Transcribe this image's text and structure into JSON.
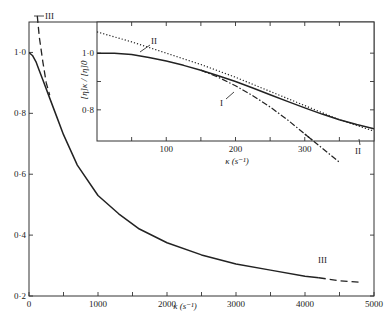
{
  "chart_data": [
    {
      "type": "line",
      "title": "",
      "xlabel": "κ (s⁻¹)",
      "ylabel": "",
      "xlim": [
        0,
        5000
      ],
      "ylim": [
        0.2,
        1.1
      ],
      "x_ticks": [
        0,
        1000,
        2000,
        3000,
        4000,
        5000
      ],
      "x_minor_ticks": [
        500,
        1500,
        2500,
        3500,
        4500
      ],
      "x_tick_labels": [
        "0",
        "1000",
        "2000",
        "3000",
        "4000",
        "5000"
      ],
      "y_ticks": [
        0.2,
        0.4,
        0.6,
        0.8,
        1.0
      ],
      "y_tick_labels": [
        "0·2",
        "0·4",
        "0·6",
        "0·8",
        "1·0"
      ],
      "grid": false,
      "series": [
        {
          "name": "solid curve",
          "style": "solid",
          "x": [
            0,
            50,
            100,
            150,
            200,
            300,
            400,
            500,
            700,
            1000,
            1300,
            1600,
            2000,
            2500,
            3000,
            3500,
            4000,
            4200
          ],
          "y": [
            1.0,
            0.99,
            0.97,
            0.94,
            0.91,
            0.85,
            0.79,
            0.73,
            0.63,
            0.53,
            0.47,
            0.42,
            0.375,
            0.335,
            0.305,
            0.285,
            0.265,
            0.26
          ]
        },
        {
          "name": "III",
          "style": "dashed",
          "x": [
            120,
            150,
            200,
            250,
            300,
            4200,
            4500,
            4800
          ],
          "y": [
            1.12,
            1.05,
            0.97,
            0.9,
            0.86,
            0.26,
            0.25,
            0.245
          ]
        }
      ],
      "annotations": [
        {
          "text": "III",
          "x": 250,
          "y": 1.1
        },
        {
          "text": "III",
          "x": 4350,
          "y": 0.31
        }
      ]
    },
    {
      "type": "line",
      "title": "inset",
      "xlabel": "κ (s⁻¹)",
      "ylabel": "[η]κ / [η]0",
      "xlim": [
        0,
        400
      ],
      "ylim": [
        0.69,
        1.11
      ],
      "x_ticks": [
        100,
        200,
        300
      ],
      "x_minor_ticks": [
        50,
        150,
        250,
        350
      ],
      "x_tick_labels": [
        "100",
        "200",
        "300"
      ],
      "y_ticks": [
        0.8,
        1.0
      ],
      "y_minor_ticks": [
        0.9
      ],
      "y_tick_labels": [
        "0·8",
        "1·0"
      ],
      "grid": false,
      "series": [
        {
          "name": "solid",
          "style": "solid",
          "x": [
            0,
            25,
            50,
            75,
            100,
            125,
            150,
            175,
            200,
            225,
            250,
            275,
            300,
            325,
            350,
            375,
            400
          ],
          "y": [
            1.0,
            1.0,
            0.995,
            0.985,
            0.972,
            0.957,
            0.94,
            0.92,
            0.9,
            0.877,
            0.853,
            0.83,
            0.807,
            0.785,
            0.765,
            0.748,
            0.733
          ]
        },
        {
          "name": "I",
          "style": "dash-dot",
          "x": [
            150,
            175,
            200,
            225,
            250,
            275,
            300,
            325,
            350
          ],
          "y": [
            0.94,
            0.915,
            0.885,
            0.85,
            0.81,
            0.765,
            0.715,
            0.665,
            0.615
          ]
        },
        {
          "name": "II",
          "style": "dotted",
          "x": [
            0,
            50,
            100,
            150,
            200,
            250,
            300,
            350,
            400
          ],
          "y": [
            1.075,
            1.04,
            1.0,
            0.96,
            0.915,
            0.865,
            0.815,
            0.765,
            0.725
          ]
        }
      ],
      "annotations": [
        {
          "text": "II",
          "x": 75,
          "y": 1.07
        },
        {
          "text": "I",
          "x": 180,
          "y": 0.8
        },
        {
          "text": "II",
          "x": 375,
          "y": 0.67
        }
      ]
    }
  ],
  "labels": {
    "main_x_axis": "κ (s⁻¹)",
    "inset_x_axis": "κ (s⁻¹)",
    "inset_y_axis": "[η]κ / [η]0",
    "curve_III": "III",
    "curve_II": "II",
    "curve_I": "I"
  }
}
